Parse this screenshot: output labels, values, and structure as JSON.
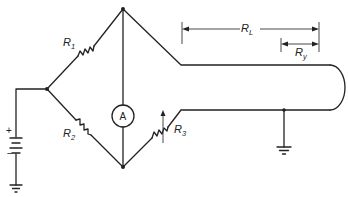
{
  "diagram": {
    "type": "Wheatstone bridge cable fault locator circuit",
    "labels": {
      "r1": {
        "main": "R",
        "sub": "1"
      },
      "r2": {
        "main": "R",
        "sub": "2"
      },
      "r3": {
        "main": "R",
        "sub": "3"
      },
      "rl": {
        "main": "R",
        "sub": "L"
      },
      "ry": {
        "main": "R",
        "sub": "y"
      },
      "ammeter": "A",
      "battery_plus": "+",
      "battery_minus": "−"
    },
    "components": [
      "battery",
      "ground-left",
      "resistor-r1",
      "resistor-r2",
      "variable-resistor-r3",
      "ammeter",
      "cable-loop",
      "ground-right",
      "dimension-rl",
      "dimension-ry"
    ],
    "colors": {
      "line": "#222222",
      "background": "#ffffff"
    }
  }
}
